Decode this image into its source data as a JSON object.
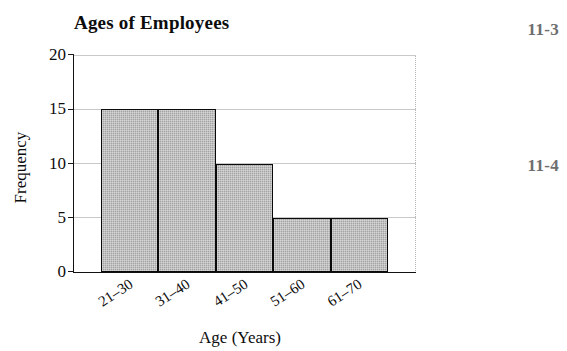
{
  "chart_data": {
    "type": "bar",
    "title": "Ages of Employees",
    "xlabel": "Age (Years)",
    "ylabel": "Frequency",
    "categories": [
      "21–30",
      "31–40",
      "41–50",
      "51–60",
      "61–70"
    ],
    "values": [
      15,
      15,
      10,
      5,
      5
    ],
    "ylim": [
      0,
      20
    ],
    "yticks": [
      0,
      5,
      10,
      15,
      20
    ],
    "ytick_labels": [
      "0",
      "5",
      "10",
      "15",
      "20"
    ],
    "grid": true,
    "legend": null,
    "bar_fill_color": "#a3a3a3",
    "bar_edge_color": "#0a0a0a",
    "gridline_color": "#c9c9c9",
    "axis_color": "#111111",
    "text_color": "#0d0d0d",
    "xtick_rotation_degrees": -33,
    "bars_adjacent": true
  },
  "margin_notes": [
    {
      "label": "11-3"
    },
    {
      "label": "11-4"
    }
  ]
}
